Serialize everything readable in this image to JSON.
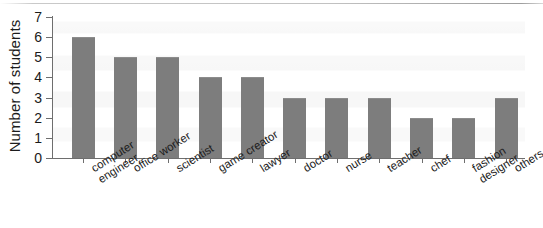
{
  "chart_data": {
    "type": "bar",
    "title": "",
    "xlabel": "",
    "ylabel": "Number of students",
    "ylim": [
      0,
      7
    ],
    "yticks": [
      0,
      1,
      2,
      3,
      4,
      5,
      6,
      7
    ],
    "grid": false,
    "legend": null,
    "bar_color": "#7d7d7d",
    "axis_color": "#6e6e6e",
    "categories": [
      "computer engineer",
      "office worker",
      "scientist",
      "game creator",
      "lawyer",
      "doctor",
      "nurse",
      "teacher",
      "chef",
      "fashion designer",
      "others"
    ],
    "category_lines": [
      [
        "computer",
        "engineer"
      ],
      [
        "office worker"
      ],
      [
        "scientist"
      ],
      [
        "game creator"
      ],
      [
        "lawyer"
      ],
      [
        "doctor"
      ],
      [
        "nurse"
      ],
      [
        "teacher"
      ],
      [
        "chef"
      ],
      [
        "fashion",
        "designer"
      ],
      [
        "others"
      ]
    ],
    "values": [
      6,
      5,
      5,
      4,
      4,
      3,
      3,
      3,
      2,
      2,
      3
    ]
  }
}
